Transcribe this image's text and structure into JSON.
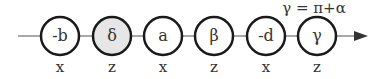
{
  "diagram": {
    "annotation": "γ = π+α",
    "nodes": [
      {
        "label": "-b",
        "axis": "x",
        "shaded": false
      },
      {
        "label": "δ",
        "axis": "z",
        "shaded": true
      },
      {
        "label": "a",
        "axis": "x",
        "shaded": false
      },
      {
        "label": "β",
        "axis": "z",
        "shaded": false
      },
      {
        "label": "-d",
        "axis": "x",
        "shaded": false
      },
      {
        "label": "γ",
        "axis": "z",
        "shaded": false
      }
    ],
    "colors": {
      "stroke": "#1a1a1a",
      "shade": "#e6e6e6",
      "line": "#555555"
    }
  }
}
